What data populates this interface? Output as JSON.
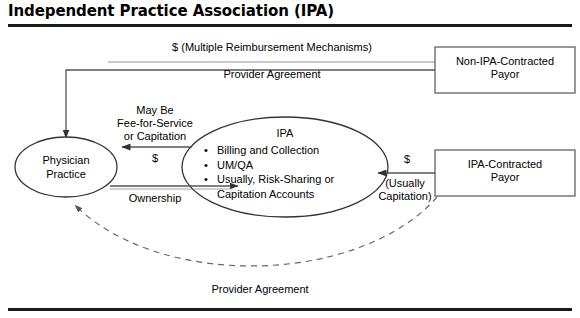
{
  "figure": {
    "title": "Independent Practice Association (IPA)",
    "type": "flow-diagram"
  },
  "nodes": {
    "physician_practice": {
      "shape": "ellipse",
      "line1": "Physician",
      "line2": "Practice"
    },
    "ipa": {
      "shape": "ellipse",
      "heading": "IPA",
      "bullets": [
        "Billing and Collection",
        "UM/QA",
        "Usually, Risk-Sharing or",
        "Capitation Accounts"
      ]
    },
    "non_ipa_payor": {
      "shape": "rectangle",
      "line1": "Non-IPA-Contracted",
      "line2": "Payor"
    },
    "ipa_payor": {
      "shape": "rectangle",
      "line1": "IPA-Contracted",
      "line2": "Payor"
    }
  },
  "edge_labels": {
    "top_money": "$ (Multiple Reimbursement Mechanisms)",
    "top_agreement": "Provider Agreement",
    "middle_terms_line1": "May Be",
    "middle_terms_line2": "Fee-for-Service",
    "middle_terms_line3": "or Capitation",
    "middle_money": "$",
    "ownership": "Ownership",
    "right_money": "$",
    "right_capitation_line1": "(Usually",
    "right_capitation_line2": "Capitation)",
    "bottom_agreement": "Provider Agreement"
  },
  "colors": {
    "stroke": "#333333",
    "rule": "#1a1a1a",
    "text": "#000000",
    "background": "#ffffff"
  }
}
